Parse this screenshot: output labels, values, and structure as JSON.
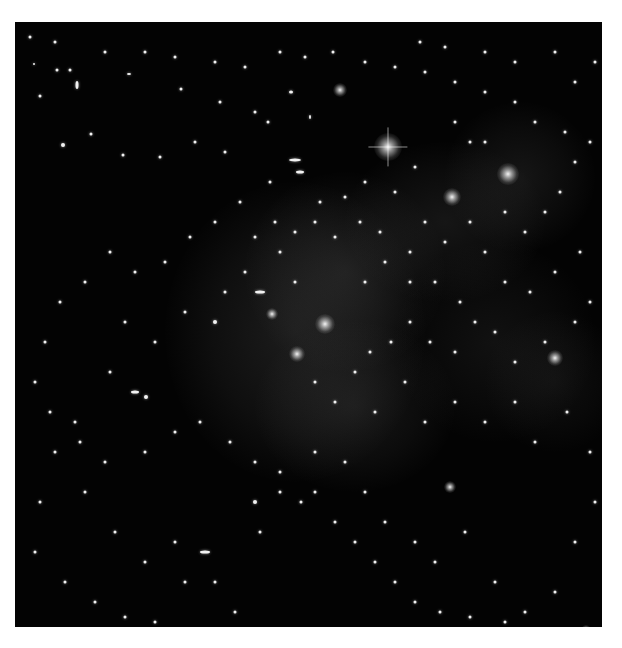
{
  "image": {
    "subject": "galaxy cluster field with diffuse halo overlay",
    "colors": {
      "background": "#030303",
      "haze": "#6a6a6a",
      "objects": "#f2f2f2",
      "page": "#ffffff"
    },
    "haze_regions": [
      {
        "x": 150,
        "y": 160,
        "w": 260,
        "h": 300,
        "o": 0.22
      },
      {
        "x": 230,
        "y": 150,
        "w": 200,
        "h": 200,
        "o": 0.18
      },
      {
        "x": 330,
        "y": 120,
        "w": 200,
        "h": 160,
        "o": 0.16
      },
      {
        "x": 430,
        "y": 80,
        "w": 150,
        "h": 150,
        "o": 0.16
      },
      {
        "x": 240,
        "y": 300,
        "w": 200,
        "h": 170,
        "o": 0.17
      },
      {
        "x": 380,
        "y": 220,
        "w": 200,
        "h": 200,
        "o": 0.12
      },
      {
        "x": 470,
        "y": 290,
        "w": 140,
        "h": 140,
        "o": 0.1
      }
    ],
    "bright_sources": [
      {
        "x": 373,
        "y": 125,
        "r": 28,
        "spikes": true
      },
      {
        "x": 493,
        "y": 152,
        "r": 22
      },
      {
        "x": 437,
        "y": 175,
        "r": 18
      },
      {
        "x": 310,
        "y": 302,
        "r": 20
      },
      {
        "x": 282,
        "y": 332,
        "r": 16
      },
      {
        "x": 325,
        "y": 68,
        "r": 14
      },
      {
        "x": 540,
        "y": 336,
        "r": 16
      },
      {
        "x": 435,
        "y": 465,
        "r": 12
      },
      {
        "x": 571,
        "y": 608,
        "r": 10
      },
      {
        "x": 257,
        "y": 292,
        "r": 12
      }
    ],
    "galaxies": [
      [
        55,
        48,
        3,
        3
      ],
      [
        114,
        52,
        4,
        2
      ],
      [
        166,
        67,
        3,
        3
      ],
      [
        205,
        80,
        3,
        3
      ],
      [
        240,
        90,
        3,
        3
      ],
      [
        253,
        100,
        3,
        3
      ],
      [
        276,
        70,
        4,
        3
      ],
      [
        295,
        95,
        2,
        4
      ],
      [
        280,
        138,
        12,
        3
      ],
      [
        285,
        150,
        8,
        3
      ],
      [
        210,
        130,
        3,
        3
      ],
      [
        180,
        120,
        3,
        3
      ],
      [
        145,
        135,
        3,
        3
      ],
      [
        108,
        133,
        3,
        3
      ],
      [
        76,
        112,
        3,
        3
      ],
      [
        48,
        123,
        4,
        4
      ],
      [
        25,
        74,
        3,
        3
      ],
      [
        62,
        63,
        3,
        8
      ],
      [
        42,
        48,
        3,
        3
      ],
      [
        19,
        42,
        2,
        2
      ],
      [
        255,
        160,
        3,
        3
      ],
      [
        230,
        250,
        3,
        3
      ],
      [
        245,
        270,
        10,
        3
      ],
      [
        210,
        270,
        3,
        3
      ],
      [
        200,
        300,
        4,
        4
      ],
      [
        170,
        290,
        3,
        3
      ],
      [
        140,
        320,
        3,
        3
      ],
      [
        110,
        300,
        3,
        3
      ],
      [
        95,
        350,
        3,
        3
      ],
      [
        120,
        370,
        8,
        3
      ],
      [
        131,
        375,
        4,
        4
      ],
      [
        60,
        400,
        3,
        3
      ],
      [
        40,
        430,
        3,
        3
      ],
      [
        25,
        480,
        3,
        3
      ],
      [
        70,
        470,
        3,
        3
      ],
      [
        100,
        510,
        3,
        3
      ],
      [
        130,
        540,
        3,
        3
      ],
      [
        160,
        520,
        3,
        3
      ],
      [
        190,
        530,
        10,
        3
      ],
      [
        170,
        560,
        3,
        3
      ],
      [
        200,
        560,
        3,
        3
      ],
      [
        220,
        590,
        3,
        3
      ],
      [
        240,
        480,
        4,
        4
      ],
      [
        245,
        510,
        3,
        3
      ],
      [
        265,
        470,
        3,
        3
      ],
      [
        286,
        480,
        3,
        3
      ],
      [
        300,
        430,
        3,
        3
      ],
      [
        330,
        440,
        3,
        3
      ],
      [
        350,
        470,
        3,
        3
      ],
      [
        370,
        500,
        3,
        3
      ],
      [
        400,
        520,
        3,
        3
      ],
      [
        420,
        540,
        3,
        3
      ],
      [
        450,
        510,
        3,
        3
      ],
      [
        480,
        560,
        3,
        3
      ],
      [
        510,
        590,
        3,
        3
      ],
      [
        540,
        570,
        3,
        3
      ],
      [
        560,
        520,
        3,
        3
      ],
      [
        580,
        480,
        3,
        3
      ],
      [
        575,
        430,
        3,
        3
      ],
      [
        552,
        390,
        3,
        3
      ],
      [
        520,
        420,
        3,
        3
      ],
      [
        500,
        380,
        3,
        3
      ],
      [
        470,
        400,
        3,
        3
      ],
      [
        440,
        380,
        3,
        3
      ],
      [
        410,
        400,
        3,
        3
      ],
      [
        390,
        360,
        3,
        3
      ],
      [
        360,
        390,
        3,
        3
      ],
      [
        340,
        350,
        3,
        3
      ],
      [
        320,
        380,
        3,
        3
      ],
      [
        300,
        360,
        3,
        3
      ],
      [
        350,
        260,
        3,
        3
      ],
      [
        370,
        240,
        3,
        3
      ],
      [
        395,
        230,
        3,
        3
      ],
      [
        410,
        200,
        3,
        3
      ],
      [
        430,
        220,
        3,
        3
      ],
      [
        455,
        200,
        3,
        3
      ],
      [
        470,
        230,
        3,
        3
      ],
      [
        490,
        190,
        3,
        3
      ],
      [
        510,
        210,
        3,
        3
      ],
      [
        530,
        190,
        3,
        3
      ],
      [
        545,
        170,
        3,
        3
      ],
      [
        560,
        140,
        3,
        3
      ],
      [
        575,
        120,
        3,
        3
      ],
      [
        550,
        110,
        3,
        3
      ],
      [
        520,
        100,
        3,
        3
      ],
      [
        500,
        80,
        3,
        3
      ],
      [
        470,
        70,
        3,
        3
      ],
      [
        440,
        60,
        3,
        3
      ],
      [
        410,
        50,
        3,
        3
      ],
      [
        380,
        45,
        3,
        3
      ],
      [
        350,
        40,
        3,
        3
      ],
      [
        318,
        30,
        3,
        3
      ],
      [
        290,
        35,
        3,
        3
      ],
      [
        265,
        30,
        3,
        3
      ],
      [
        230,
        45,
        3,
        3
      ],
      [
        200,
        40,
        3,
        3
      ],
      [
        160,
        35,
        3,
        3
      ],
      [
        130,
        30,
        3,
        3
      ],
      [
        90,
        30,
        3,
        3
      ],
      [
        40,
        20,
        3,
        3
      ],
      [
        15,
        15,
        3,
        3
      ],
      [
        560,
        60,
        3,
        3
      ],
      [
        580,
        40,
        3,
        3
      ],
      [
        540,
        30,
        3,
        3
      ],
      [
        500,
        40,
        3,
        3
      ],
      [
        470,
        30,
        3,
        3
      ],
      [
        430,
        25,
        3,
        3
      ],
      [
        405,
        20,
        3,
        3
      ],
      [
        440,
        100,
        3,
        3
      ],
      [
        455,
        120,
        3,
        3
      ],
      [
        470,
        120,
        3,
        3
      ],
      [
        400,
        145,
        3,
        3
      ],
      [
        380,
        170,
        3,
        3
      ],
      [
        350,
        160,
        3,
        3
      ],
      [
        330,
        175,
        3,
        3
      ],
      [
        305,
        180,
        3,
        3
      ],
      [
        300,
        200,
        3,
        3
      ],
      [
        320,
        215,
        3,
        3
      ],
      [
        345,
        200,
        3,
        3
      ],
      [
        365,
        210,
        3,
        3
      ],
      [
        395,
        260,
        3,
        3
      ],
      [
        420,
        260,
        3,
        3
      ],
      [
        445,
        280,
        3,
        3
      ],
      [
        460,
        300,
        3,
        3
      ],
      [
        490,
        260,
        3,
        3
      ],
      [
        515,
        270,
        3,
        3
      ],
      [
        540,
        250,
        3,
        3
      ],
      [
        565,
        230,
        3,
        3
      ],
      [
        575,
        280,
        3,
        3
      ],
      [
        560,
        300,
        3,
        3
      ],
      [
        530,
        320,
        3,
        3
      ],
      [
        500,
        340,
        3,
        3
      ],
      [
        480,
        310,
        3,
        3
      ],
      [
        440,
        330,
        3,
        3
      ],
      [
        415,
        320,
        3,
        3
      ],
      [
        395,
        300,
        3,
        3
      ],
      [
        376,
        320,
        3,
        3
      ],
      [
        355,
        330,
        3,
        3
      ],
      [
        280,
        260,
        3,
        3
      ],
      [
        265,
        230,
        3,
        3
      ],
      [
        240,
        215,
        3,
        3
      ],
      [
        260,
        200,
        3,
        3
      ],
      [
        280,
        210,
        3,
        3
      ],
      [
        225,
        180,
        3,
        3
      ],
      [
        200,
        200,
        3,
        3
      ],
      [
        175,
        215,
        3,
        3
      ],
      [
        150,
        240,
        3,
        3
      ],
      [
        120,
        250,
        3,
        3
      ],
      [
        95,
        230,
        3,
        3
      ],
      [
        70,
        260,
        3,
        3
      ],
      [
        45,
        280,
        3,
        3
      ],
      [
        30,
        320,
        3,
        3
      ],
      [
        20,
        360,
        3,
        3
      ],
      [
        35,
        390,
        3,
        3
      ],
      [
        65,
        420,
        3,
        3
      ],
      [
        90,
        440,
        3,
        3
      ],
      [
        130,
        430,
        3,
        3
      ],
      [
        160,
        410,
        3,
        3
      ],
      [
        185,
        400,
        3,
        3
      ],
      [
        215,
        420,
        3,
        3
      ],
      [
        240,
        440,
        3,
        3
      ],
      [
        265,
        450,
        3,
        3
      ],
      [
        300,
        470,
        3,
        3
      ],
      [
        320,
        500,
        3,
        3
      ],
      [
        340,
        520,
        3,
        3
      ],
      [
        360,
        540,
        3,
        3
      ],
      [
        380,
        560,
        3,
        3
      ],
      [
        400,
        580,
        3,
        3
      ],
      [
        425,
        590,
        3,
        3
      ],
      [
        455,
        595,
        3,
        3
      ],
      [
        490,
        600,
        3,
        3
      ],
      [
        20,
        530,
        3,
        3
      ],
      [
        50,
        560,
        3,
        3
      ],
      [
        80,
        580,
        3,
        3
      ],
      [
        110,
        595,
        3,
        3
      ],
      [
        140,
        600,
        3,
        3
      ]
    ]
  }
}
